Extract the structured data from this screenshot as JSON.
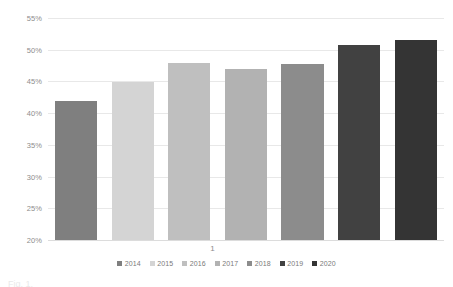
{
  "chart_data": {
    "type": "bar",
    "title": "",
    "subtitle": "",
    "xlabel": "",
    "ylabel": "",
    "categories": [
      "1"
    ],
    "ylim": [
      20,
      55
    ],
    "ytick_labels": [
      "55%",
      "50%",
      "45%",
      "40%",
      "35%",
      "30%",
      "25%",
      "20%"
    ],
    "ytick_values": [
      55,
      50,
      45,
      40,
      35,
      30,
      25,
      20
    ],
    "grid": true,
    "legend_position": "bottom",
    "value_suffix": "%",
    "series": [
      {
        "name": "2014",
        "values": [
          41.9
        ],
        "color": "#7f7f7f"
      },
      {
        "name": "2015",
        "values": [
          44.9
        ],
        "color": "#d4d4d4"
      },
      {
        "name": "2016",
        "values": [
          47.9
        ],
        "color": "#bfbfbf"
      },
      {
        "name": "2017",
        "values": [
          47.0
        ],
        "color": "#b2b2b2"
      },
      {
        "name": "2018",
        "values": [
          47.7
        ],
        "color": "#8c8c8c"
      },
      {
        "name": "2019",
        "values": [
          50.7
        ],
        "color": "#414141"
      },
      {
        "name": "2020",
        "values": [
          51.6
        ],
        "color": "#343434"
      }
    ]
  },
  "axis": {
    "x_category_label": "1"
  },
  "legend": {
    "entries": [
      {
        "label": "2014",
        "color": "#7f7f7f"
      },
      {
        "label": "2015",
        "color": "#d4d4d4"
      },
      {
        "label": "2016",
        "color": "#bfbfbf"
      },
      {
        "label": "2017",
        "color": "#b2b2b2"
      },
      {
        "label": "2018",
        "color": "#8c8c8c"
      },
      {
        "label": "2019",
        "color": "#414141"
      },
      {
        "label": "2020",
        "color": "#343434"
      }
    ]
  },
  "artifact": {
    "bottom_text": "Fig. 1."
  }
}
